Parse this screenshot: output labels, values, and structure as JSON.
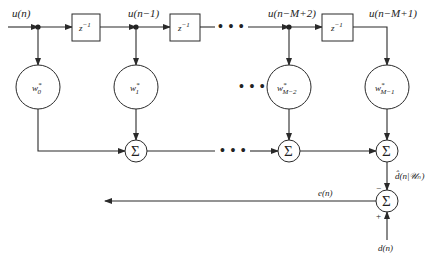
{
  "diagram": {
    "type": "transversal-filter",
    "signals": {
      "input": "u(n)",
      "tap1": "u(n−1)",
      "tapM2": "u(n−M+2)",
      "tapM1": "u(n−M+1)",
      "estimate": "d̂(n|𝒰ₙ)",
      "error": "e(n)",
      "desired": "d(n)"
    },
    "delay_label": "z",
    "delay_exp": "−1",
    "weights": [
      {
        "base": "w",
        "sup": "*",
        "sub": "0"
      },
      {
        "base": "w",
        "sup": "*",
        "sub": "1"
      },
      {
        "base": "w",
        "sup": "*",
        "sub": "M−2"
      },
      {
        "base": "w",
        "sup": "*",
        "sub": "M−1"
      }
    ],
    "sum_symbol": "Σ",
    "ellipsis": "• • •",
    "signs": {
      "minus": "−",
      "plus": "+"
    }
  }
}
